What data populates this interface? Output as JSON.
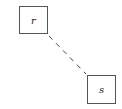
{
  "diagram": {
    "nodes": [
      {
        "id": "r",
        "label": "r"
      },
      {
        "id": "s",
        "label": "s"
      }
    ],
    "edges": [
      {
        "from": "r",
        "to": "s",
        "style": "dashed",
        "color": "#444444"
      }
    ]
  }
}
